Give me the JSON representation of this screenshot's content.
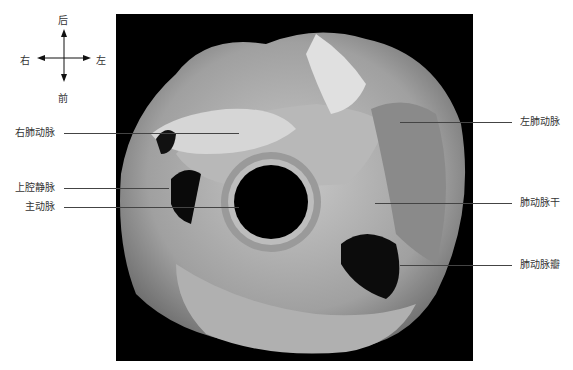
{
  "compass": {
    "top": "后",
    "bottom": "前",
    "left": "右",
    "right": "左"
  },
  "labels": {
    "left": [
      {
        "text": "右肺动脉",
        "y": 133
      },
      {
        "text": "上腔静脉",
        "y": 188
      },
      {
        "text": "主动脉",
        "y": 207
      }
    ],
    "right": [
      {
        "text": "左肺动脉",
        "y": 122
      },
      {
        "text": "肺动脉干",
        "y": 203
      },
      {
        "text": "肺动脉瓣",
        "y": 265
      }
    ]
  },
  "colors": {
    "background": "#000000",
    "tissue": "#a8a8a8"
  }
}
